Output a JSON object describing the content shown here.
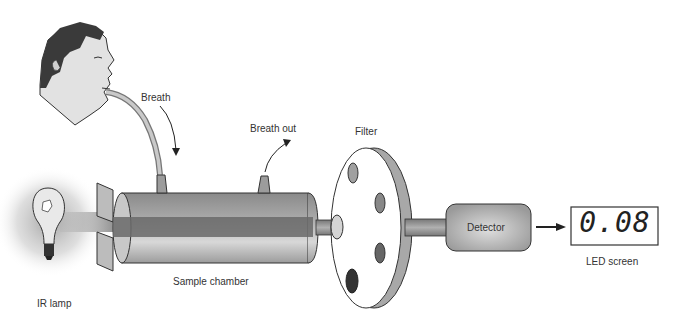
{
  "diagram": {
    "labels": {
      "breath": "Breath",
      "breath_out": "Breath out",
      "filter": "Filter",
      "detector": "Detector",
      "led_screen": "LED screen",
      "sample_chamber": "Sample chamber",
      "ir_lamp": "IR lamp"
    },
    "led_reading": "0.08",
    "colors": {
      "outline": "#222222",
      "chamber_gray": "#9a9a9a",
      "beam_dark": "#555555",
      "skin": "#e0e0e0",
      "hair": "#333333"
    }
  }
}
